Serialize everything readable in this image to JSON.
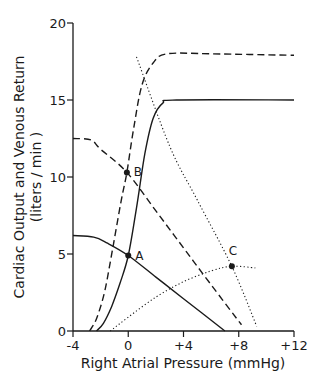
{
  "chart_data": {
    "type": "line",
    "title": "",
    "xlabel": "Right Atrial Pressure (mmHg)",
    "ylabel_line1": "Cardiac Output and Venous Return",
    "ylabel_line2": "(liters / min )",
    "xlim": [
      -4,
      12
    ],
    "ylim": [
      0,
      20
    ],
    "x_ticks": [
      -4,
      0,
      4,
      8,
      12
    ],
    "x_tick_labels": [
      "-4",
      "0",
      "+4",
      "+8",
      "+12"
    ],
    "y_ticks": [
      0,
      5,
      10,
      15,
      20
    ],
    "y_tick_labels": [
      "0",
      "5",
      "10",
      "15",
      "20"
    ],
    "grid": false,
    "legend": null,
    "series": [
      {
        "name": "Cardiac output (normal)",
        "style": "solid",
        "points": [
          [
            -2.3,
            0
          ],
          [
            -1.8,
            0.5
          ],
          [
            -1.2,
            1.6
          ],
          [
            -0.6,
            3.1
          ],
          [
            0,
            4.9
          ],
          [
            0.6,
            8
          ],
          [
            1.2,
            11.5
          ],
          [
            1.8,
            13.8
          ],
          [
            2.5,
            14.8
          ],
          [
            3.5,
            15
          ],
          [
            12,
            15
          ]
        ]
      },
      {
        "name": "Cardiac output (increased)",
        "style": "dashed",
        "points": [
          [
            -2.8,
            0
          ],
          [
            -2.3,
            0.8
          ],
          [
            -1.7,
            2.6
          ],
          [
            -1.1,
            5.5
          ],
          [
            -0.5,
            8.5
          ],
          [
            -0.1,
            10.3
          ],
          [
            0.4,
            13.2
          ],
          [
            1,
            16
          ],
          [
            1.8,
            17.4
          ],
          [
            2.8,
            18
          ],
          [
            6,
            18
          ],
          [
            12,
            17.9
          ]
        ]
      },
      {
        "name": "Cardiac output (decreased)",
        "style": "dotted",
        "points": [
          [
            -1.3,
            0
          ],
          [
            0,
            0.9
          ],
          [
            2,
            2.2
          ],
          [
            4,
            3.2
          ],
          [
            6,
            3.9
          ],
          [
            7.5,
            4.2
          ],
          [
            9.2,
            4.1
          ]
        ]
      },
      {
        "name": "Venous return (normal)",
        "style": "solid",
        "points": [
          [
            -4,
            6.2
          ],
          [
            -2.5,
            6.1
          ],
          [
            -1.5,
            5.7
          ],
          [
            0,
            4.9
          ],
          [
            2,
            3.5
          ],
          [
            4,
            2.1
          ],
          [
            7,
            0
          ]
        ]
      },
      {
        "name": "Venous return (increased)",
        "style": "dashed",
        "points": [
          [
            -4,
            12.5
          ],
          [
            -2.7,
            12.4
          ],
          [
            -2,
            11.8
          ],
          [
            -0.1,
            10.3
          ],
          [
            2,
            7.8
          ],
          [
            4,
            5.4
          ],
          [
            6,
            3
          ],
          [
            8.2,
            0.4
          ]
        ]
      },
      {
        "name": "Venous return (decreased slope)",
        "style": "dotted",
        "points": [
          [
            0.6,
            17.8
          ],
          [
            3,
            12
          ],
          [
            5,
            8.5
          ],
          [
            7.5,
            4.2
          ],
          [
            9.3,
            0.3
          ]
        ]
      }
    ],
    "annotations": [
      {
        "label": "A",
        "x": 0,
        "y": 4.9
      },
      {
        "label": "B",
        "x": -0.1,
        "y": 10.3
      },
      {
        "label": "C",
        "x": 7.5,
        "y": 4.2
      }
    ]
  }
}
